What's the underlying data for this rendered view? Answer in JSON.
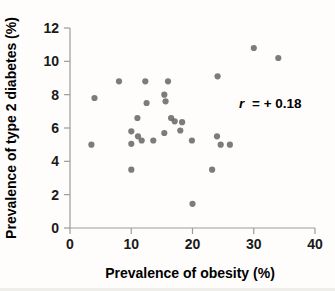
{
  "chart_data": {
    "type": "scatter",
    "title": "",
    "xlabel": "Prevalence of obesity (%)",
    "ylabel": "Prevalence of type 2 diabetes (%)",
    "xlim": [
      0,
      40
    ],
    "ylim": [
      0,
      12
    ],
    "xticks": [
      0,
      10,
      20,
      30,
      40
    ],
    "yticks": [
      0,
      2,
      4,
      6,
      8,
      10,
      12
    ],
    "grid": false,
    "legend_position": "none",
    "annotation": {
      "full_text": "r = + 0.18",
      "symbol": "r",
      "rest": "= + 0.18"
    },
    "points": [
      [
        8.0,
        8.8
      ],
      [
        12.3,
        8.8
      ],
      [
        16.0,
        8.8
      ],
      [
        24.1,
        9.1
      ],
      [
        30.0,
        10.8
      ],
      [
        34.0,
        10.2
      ],
      [
        4.0,
        7.8
      ],
      [
        15.4,
        8.0
      ],
      [
        15.6,
        7.6
      ],
      [
        12.5,
        7.5
      ],
      [
        11.0,
        6.6
      ],
      [
        16.5,
        6.6
      ],
      [
        17.1,
        6.4
      ],
      [
        18.3,
        6.35
      ],
      [
        18.0,
        5.85
      ],
      [
        15.4,
        5.7
      ],
      [
        10.0,
        5.8
      ],
      [
        11.1,
        5.5
      ],
      [
        24.0,
        5.5
      ],
      [
        11.7,
        5.25
      ],
      [
        10.0,
        5.05
      ],
      [
        13.6,
        5.25
      ],
      [
        3.5,
        5.0
      ],
      [
        19.9,
        5.25
      ],
      [
        24.6,
        5.0
      ],
      [
        26.1,
        5.0
      ],
      [
        10.0,
        3.5
      ],
      [
        23.2,
        3.5
      ],
      [
        20.0,
        1.45
      ]
    ],
    "colors": {
      "point": "#666666",
      "axis": "#9c9c9c",
      "text": "#1a1a1a",
      "background": "#fefdfb"
    }
  }
}
